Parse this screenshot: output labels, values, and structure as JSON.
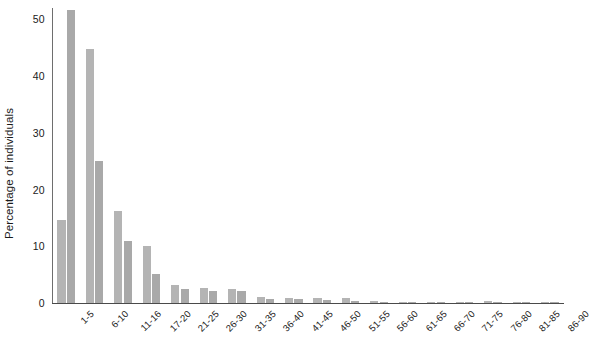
{
  "chart_data": {
    "type": "bar",
    "title": "",
    "subtitle": "",
    "xlabel": "",
    "ylabel": "Percentage of individuals",
    "ylim": [
      0,
      52
    ],
    "yticks": [
      0,
      10,
      20,
      30,
      40,
      50
    ],
    "ytick_labels": [
      "0",
      "10",
      "20",
      "30",
      "40",
      "50"
    ],
    "grid": false,
    "legend": "none",
    "orientation": "vertical",
    "grouping": "grouped",
    "categories": [
      "1-5",
      "6-10",
      "11-16",
      "17-20",
      "21-25",
      "26-30",
      "31-35",
      "36-40",
      "41-45",
      "46-50",
      "51-55",
      "56-60",
      "61-65",
      "66-70",
      "71-75",
      "76-80",
      "81-85",
      "86-90"
    ],
    "series": [
      {
        "name": "Series A",
        "color": "#b4b4b4",
        "values": [
          14.7,
          44.8,
          16.2,
          10.1,
          3.2,
          2.7,
          2.5,
          1.0,
          0.9,
          0.8,
          0.9,
          0.4,
          0.2,
          0.1,
          0.1,
          0.3,
          0.1,
          0.1
        ]
      },
      {
        "name": "Series B",
        "color": "#a9a9a9",
        "values": [
          51.6,
          25.1,
          11.0,
          5.1,
          2.5,
          2.2,
          2.1,
          0.7,
          0.7,
          0.6,
          0.3,
          0.2,
          0.1,
          0.1,
          0.2,
          0.1,
          0.1,
          0.1
        ]
      }
    ],
    "colors": {
      "series_a": "#b4b4b4",
      "series_b": "#a9a9a9",
      "axis": "#4a4a4a",
      "text": "#1a1a1a",
      "background": "#ffffff"
    }
  }
}
